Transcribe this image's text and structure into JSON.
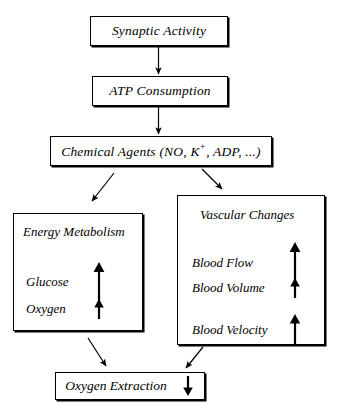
{
  "diagram": {
    "background_color": "#ffffff",
    "line_color": "#000000"
  },
  "nodes": {
    "synaptic_activity": {
      "label": "Synaptic Activity"
    },
    "atp_consumption": {
      "label": "ATP Consumption"
    },
    "chemical_agents": {
      "label_prefix": "Chemical Agents (NO, K",
      "label_superscript": "+",
      "label_suffix": ", ADP, ...)"
    },
    "energy_metabolism": {
      "title": "Energy Metabolism",
      "rows": [
        {
          "label": "Glucose",
          "trend": "up",
          "arrow_size": "large"
        },
        {
          "label": "Oxygen",
          "trend": "up",
          "arrow_size": "small"
        }
      ]
    },
    "vascular_changes": {
      "title": "Vascular Changes",
      "rows": [
        {
          "label": "Blood Flow",
          "trend": "up",
          "arrow_size": "large"
        },
        {
          "label": "Blood Volume",
          "trend": "up",
          "arrow_size": "small"
        },
        {
          "label": "Blood Velocity",
          "trend": "up",
          "arrow_size": "medium"
        }
      ]
    },
    "oxygen_extraction": {
      "label": "Oxygen Extraction",
      "trend": "down",
      "arrow_size": "small"
    }
  },
  "edges": [
    {
      "from": "synaptic_activity",
      "to": "atp_consumption",
      "style": "vertical-arrow"
    },
    {
      "from": "atp_consumption",
      "to": "chemical_agents",
      "style": "vertical-arrow"
    },
    {
      "from": "chemical_agents",
      "to": "energy_metabolism",
      "style": "diagonal-arrow-down-left"
    },
    {
      "from": "chemical_agents",
      "to": "vascular_changes",
      "style": "diagonal-arrow-down-right"
    },
    {
      "from": "energy_metabolism",
      "to": "oxygen_extraction",
      "style": "diagonal-arrow-down-right"
    },
    {
      "from": "vascular_changes",
      "to": "oxygen_extraction",
      "style": "diagonal-arrow-down-left"
    }
  ]
}
